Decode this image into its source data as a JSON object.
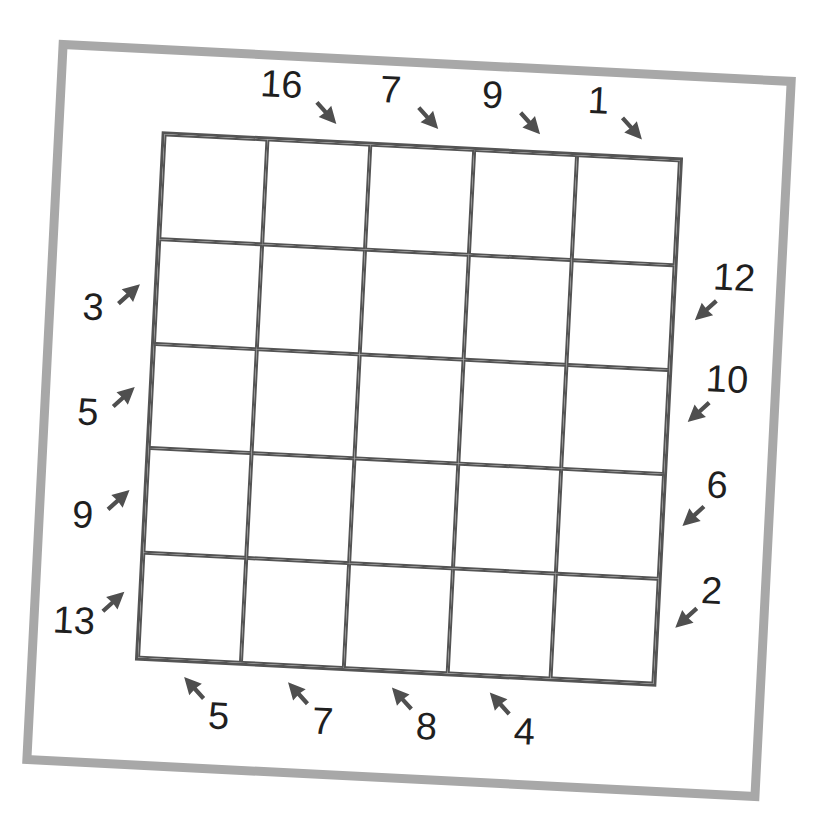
{
  "puzzle": {
    "type": "5x5 arrow-clue grid puzzle",
    "rows": 5,
    "cols": 5,
    "colors": {
      "grid_line": "#545454",
      "frame": "#a8a8a8",
      "arrow": "#4f4f4f",
      "text": "#1f1f1f",
      "background": "#ffffff"
    },
    "clues": {
      "top": [
        "16",
        "7",
        "9",
        "1"
      ],
      "left": [
        "3",
        "5",
        "9",
        "13"
      ],
      "right": [
        "12",
        "10",
        "6",
        "2"
      ],
      "bottom": [
        "5",
        "7",
        "8",
        "4"
      ]
    },
    "arrow_icons": {
      "top": "arrow-down-right-icon",
      "left": "arrow-up-right-icon",
      "right": "arrow-down-left-icon",
      "bottom": "arrow-up-left-icon"
    }
  }
}
